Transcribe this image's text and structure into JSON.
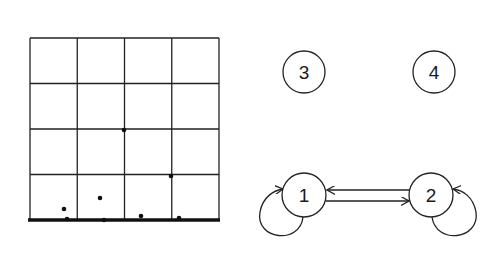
{
  "grid": {
    "rows": 4,
    "cols": 4,
    "x0": 30,
    "y0": 38,
    "x1": 219,
    "y1": 220,
    "stroke": "#222222",
    "points": [
      {
        "x": 64,
        "y": 209
      },
      {
        "x": 100,
        "y": 198
      },
      {
        "x": 141,
        "y": 216
      },
      {
        "x": 179,
        "y": 218
      },
      {
        "x": 124,
        "y": 130
      },
      {
        "x": 171,
        "y": 176
      },
      {
        "x": 67,
        "y": 219
      },
      {
        "x": 104,
        "y": 220
      }
    ]
  },
  "graph": {
    "nodes": [
      {
        "id": "3",
        "label": "3",
        "cx": 304,
        "cy": 72,
        "r": 21
      },
      {
        "id": "4",
        "label": "4",
        "cx": 434,
        "cy": 72,
        "r": 21
      },
      {
        "id": "1",
        "label": "1",
        "cx": 304,
        "cy": 195,
        "r": 22
      },
      {
        "id": "2",
        "label": "2",
        "cx": 431,
        "cy": 195,
        "r": 22
      }
    ],
    "edges": [
      {
        "from": "2",
        "to": "1",
        "type": "straight"
      },
      {
        "from": "1",
        "to": "2",
        "type": "straight"
      },
      {
        "from": "1",
        "to": "1",
        "type": "self-loop"
      },
      {
        "from": "2",
        "to": "2",
        "type": "self-loop"
      }
    ]
  }
}
